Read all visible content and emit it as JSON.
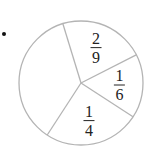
{
  "chart_data": {
    "type": "pie",
    "title": "",
    "labels": [
      "2/9",
      "1/6",
      "1/4",
      ""
    ],
    "slices": [
      {
        "label": "2/9",
        "numerator": "2",
        "denominator": "9",
        "value": 0.2222
      },
      {
        "label": "1/6",
        "numerator": "1",
        "denominator": "6",
        "value": 0.1667
      },
      {
        "label": "1/4",
        "numerator": "1",
        "denominator": "4",
        "value": 0.25
      },
      {
        "label": "",
        "numerator": "",
        "denominator": "",
        "value": 0.3611
      }
    ],
    "start_angle_deg": -107,
    "direction": "clockwise",
    "legend": "none",
    "center": [
      81,
      83
    ],
    "radius": 62,
    "colors": {
      "stroke": "#b4b4b4",
      "fill": "#ffffff",
      "text": "#222222",
      "bullet": "#111111"
    }
  },
  "bullet": {
    "symbol": "•"
  }
}
